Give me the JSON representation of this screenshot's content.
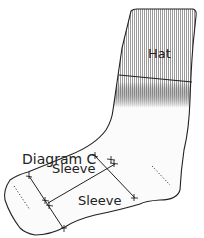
{
  "diagram": {
    "title": "Diagram C",
    "labels": {
      "hat": "Hat",
      "sleeve_upper": "Sleeve",
      "sleeve_lower": "Sleeve"
    },
    "colors": {
      "outline": "#222222",
      "hatch": "#9a9a9a",
      "fill": "#f7f7f7"
    }
  }
}
